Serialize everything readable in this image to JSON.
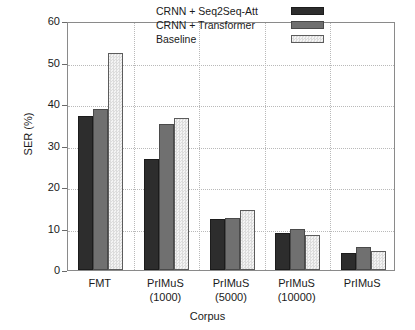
{
  "chart_data": {
    "type": "bar",
    "title": "",
    "xlabel": "Corpus",
    "ylabel": "SER (%)",
    "ylim": [
      0,
      60
    ],
    "ytick_values": [
      0,
      10,
      20,
      30,
      40,
      50,
      60
    ],
    "ytick_labels": [
      "0",
      "10",
      "20",
      "30",
      "40",
      "50",
      "60"
    ],
    "grid": true,
    "legend_position": "top-right-inside",
    "categories": [
      "FMT",
      "PrIMuS\n(1000)",
      "PrIMuS\n(5000)",
      "PrIMuS\n(10000)",
      "PrIMuS"
    ],
    "category_lines": [
      [
        "FMT",
        ""
      ],
      [
        "PrIMuS",
        "(1000)"
      ],
      [
        "PrIMuS",
        "(5000)"
      ],
      [
        "PrIMuS",
        "(10000)"
      ],
      [
        "PrIMuS",
        ""
      ]
    ],
    "series": [
      {
        "name": "CRNN + Seq2Seq-Att",
        "color": "#2d2d2d",
        "values": [
          37.0,
          26.7,
          12.2,
          8.8,
          4.2
        ]
      },
      {
        "name": "CRNN + Transformer",
        "color": "#707070",
        "values": [
          38.8,
          35.1,
          12.5,
          10.0,
          5.5
        ]
      },
      {
        "name": "Baseline",
        "color": "#e8e8e8",
        "values": [
          52.3,
          36.6,
          14.5,
          8.5,
          4.7
        ]
      }
    ]
  },
  "legend": {
    "items": [
      {
        "label": "CRNN + Seq2Seq-Att"
      },
      {
        "label": "CRNN + Transformer"
      },
      {
        "label": "Baseline"
      }
    ]
  },
  "axes": {
    "y_title": "SER (%)",
    "x_title": "Corpus"
  }
}
